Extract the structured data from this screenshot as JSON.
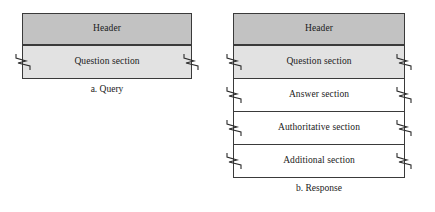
{
  "diagram": {
    "type": "dns-message-format",
    "colors": {
      "header_fill": "#c2c2c2",
      "shaded_fill": "#e2e2e2",
      "plain_fill": "#ffffff",
      "border": "#3a3a3a",
      "background": "#ffffff",
      "text": "#1a1a1a"
    },
    "figures": [
      {
        "id": "query",
        "caption": "a. Query",
        "sections": [
          {
            "label": "Header",
            "fill": "header",
            "torn": false
          },
          {
            "label": "Question section",
            "fill": "shaded",
            "torn": true
          }
        ]
      },
      {
        "id": "response",
        "caption": "b. Response",
        "sections": [
          {
            "label": "Header",
            "fill": "header",
            "torn": false
          },
          {
            "label": "Question section",
            "fill": "shaded",
            "torn": true
          },
          {
            "label": "Answer section",
            "fill": "plain",
            "torn": true
          },
          {
            "label": "Authoritative section",
            "fill": "plain",
            "torn": true
          },
          {
            "label": "Additional section",
            "fill": "plain",
            "torn": true
          }
        ]
      }
    ]
  }
}
